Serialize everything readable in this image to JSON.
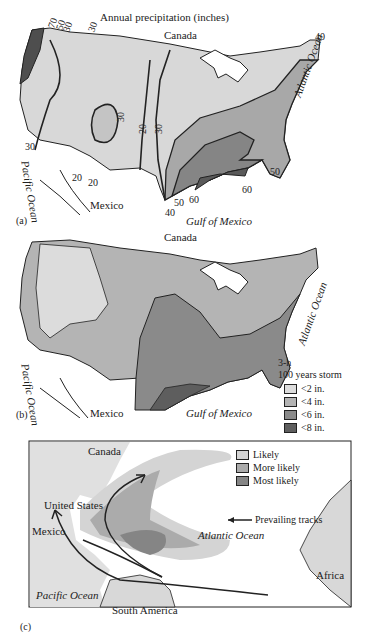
{
  "panel_a": {
    "tag": "(a)",
    "title": "Annual precipitation (inches)",
    "labels": {
      "canada": "Canada",
      "mexico": "Mexico",
      "pacific": "Pacific Ocean",
      "atlantic": "Atlantic Ocean",
      "gulf": "Gulf of Mexico"
    },
    "isolines": {
      "l70": "70",
      "l50": "50",
      "l30a": "30",
      "l30b": "30",
      "l30c": "30",
      "l30d": "30",
      "l30e": "30",
      "l20a": "20",
      "l20b": "20",
      "l20c": "20",
      "l40a": "40",
      "l40b": "40",
      "l50a": "50",
      "l50b": "50",
      "l60a": "60",
      "l60b": "60"
    }
  },
  "panel_b": {
    "tag": "(b)",
    "labels": {
      "canada": "Canada",
      "mexico": "Mexico",
      "pacific": "Pacific Ocean",
      "atlantic": "Atlantic Ocean",
      "gulf": "Gulf of Mexico"
    },
    "legend": {
      "title1": "3-h",
      "title2": "100 years storm",
      "items": [
        {
          "label": "<2 in.",
          "color": "#dcdcdc"
        },
        {
          "label": "<4 in.",
          "color": "#b4b4b4"
        },
        {
          "label": "<6 in.",
          "color": "#8a8a8a"
        },
        {
          "label": "<8 in.",
          "color": "#5e5e5e"
        }
      ]
    }
  },
  "panel_c": {
    "tag": "(c)",
    "labels": {
      "canada": "Canada",
      "us": "United States",
      "mexico": "Mexico",
      "atlantic": "Atlantic Ocean",
      "pacific": "Pacific Ocean",
      "south_america": "South America",
      "africa": "Africa"
    },
    "legend": {
      "items": [
        {
          "label": "Likely",
          "color": "#d4d4d4"
        },
        {
          "label": "More likely",
          "color": "#ababab"
        },
        {
          "label": "Most likely",
          "color": "#858585"
        }
      ],
      "tracks": "Prevailing tracks"
    }
  }
}
